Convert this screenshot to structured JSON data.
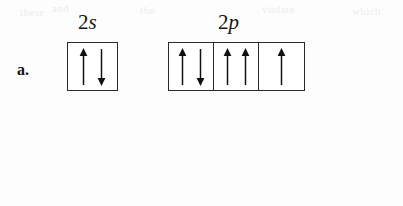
{
  "figure": {
    "type": "orbital-diagram",
    "line_color": "#2a2a2a",
    "arrow_color": "#111111",
    "background_color": "#fdfdfd"
  },
  "ghost_text": {
    "fragment_1": "and",
    "fragment_2": "these",
    "fragment_3": "the",
    "fragment_4": "violate",
    "fragment_5": "which"
  },
  "items": [
    {
      "letter": "a.",
      "groups": [
        {
          "label_principal": "2",
          "label_letter": "s",
          "label_full": "2s",
          "box_count": 1,
          "boxes": [
            {
              "arrows": [
                "up",
                "down"
              ]
            }
          ]
        },
        {
          "label_principal": "2",
          "label_letter": "p",
          "label_full": "2p",
          "box_count": 3,
          "boxes": [
            {
              "arrows": [
                "up",
                "down"
              ]
            },
            {
              "arrows": [
                "up",
                "up"
              ]
            },
            {
              "arrows": [
                "up"
              ]
            }
          ]
        }
      ]
    },
    {
      "letter": "b.",
      "groups": [
        {
          "label_principal": "4",
          "label_letter": "s",
          "label_full": "4s",
          "box_count": 1,
          "boxes": [
            {
              "arrows": [
                "up"
              ]
            }
          ]
        },
        {
          "label_principal": "3",
          "label_letter": "d",
          "label_full": "3d",
          "box_count": 5,
          "boxes": [
            {
              "arrows": [
                "up"
              ]
            },
            {
              "arrows": [
                "up"
              ]
            },
            {
              "arrows": [
                "up"
              ]
            },
            {
              "arrows": [
                "up"
              ]
            },
            {
              "arrows": [
                "up"
              ]
            }
          ]
        }
      ]
    }
  ]
}
